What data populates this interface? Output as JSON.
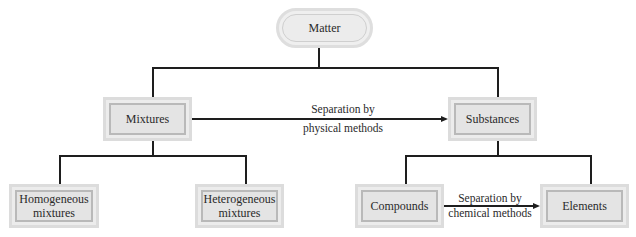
{
  "diagram": {
    "type": "hierarchy",
    "root": {
      "label": "Matter"
    },
    "level1": [
      {
        "label": "Mixtures"
      },
      {
        "label": "Substances"
      }
    ],
    "level2": [
      {
        "label_line1": "Homogeneous",
        "label_line2": "mixtures",
        "parent": "Mixtures"
      },
      {
        "label_line1": "Heterogeneous",
        "label_line2": "mixtures",
        "parent": "Mixtures"
      },
      {
        "label": "Compounds",
        "parent": "Substances"
      },
      {
        "label": "Elements",
        "parent": "Substances"
      }
    ],
    "arrows": [
      {
        "from": "Mixtures",
        "to": "Substances",
        "label_line1": "Separation by",
        "label_line2": "physical methods"
      },
      {
        "from": "Compounds",
        "to": "Elements",
        "label_line1": "Separation by",
        "label_line2": "chemical methods"
      }
    ]
  }
}
